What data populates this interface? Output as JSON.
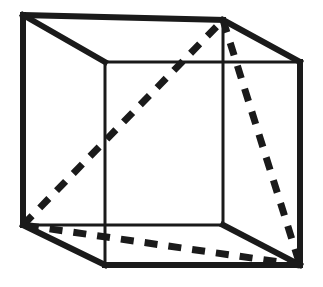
{
  "figure": {
    "type": "line-diagram",
    "canvas": {
      "width": 323,
      "height": 287,
      "background": "#ffffff"
    },
    "ink_color": "#1a1a1a",
    "stroke_widths": {
      "front_edges": 6,
      "back_edges": 3,
      "dashed": 7
    },
    "dash_pattern": "13 11",
    "vertices": {
      "back_top_left": {
        "x": 23,
        "y": 15
      },
      "back_top_right": {
        "x": 223,
        "y": 20
      },
      "back_bottom_left": {
        "x": 23,
        "y": 225
      },
      "back_bottom_right": {
        "x": 223,
        "y": 225
      },
      "front_top_left": {
        "x": 105,
        "y": 62
      },
      "front_top_right": {
        "x": 300,
        "y": 62
      },
      "front_bottom_left": {
        "x": 105,
        "y": 265
      },
      "front_bottom_right": {
        "x": 300,
        "y": 265
      }
    },
    "solid_edges": [
      {
        "name": "back-top-edge",
        "from": "back_top_left",
        "to": "back_top_right",
        "weight": "front"
      },
      {
        "name": "back-left-vertical-edge",
        "from": "back_top_left",
        "to": "back_bottom_left",
        "weight": "front"
      },
      {
        "name": "back-bottom-edge",
        "from": "back_bottom_left",
        "to": "back_bottom_right",
        "weight": "back"
      },
      {
        "name": "back-right-vertical-edge",
        "from": "back_top_right",
        "to": "back_bottom_right",
        "weight": "back"
      },
      {
        "name": "top-left-connector-edge",
        "from": "back_top_left",
        "to": "front_top_left",
        "weight": "front"
      },
      {
        "name": "top-right-connector-edge",
        "from": "back_top_right",
        "to": "front_top_right",
        "weight": "front"
      },
      {
        "name": "bottom-left-connector-edge",
        "from": "back_bottom_left",
        "to": "front_bottom_left",
        "weight": "front"
      },
      {
        "name": "bottom-right-connector-edge",
        "from": "back_bottom_right",
        "to": "front_bottom_right",
        "weight": "front"
      },
      {
        "name": "front-top-edge",
        "from": "front_top_left",
        "to": "front_top_right",
        "weight": "back"
      },
      {
        "name": "front-left-vertical-edge",
        "from": "front_top_left",
        "to": "front_bottom_left",
        "weight": "back"
      },
      {
        "name": "front-bottom-edge",
        "from": "front_bottom_left",
        "to": "front_bottom_right",
        "weight": "front"
      },
      {
        "name": "front-right-vertical-edge",
        "from": "front_top_right",
        "to": "front_bottom_right",
        "weight": "front"
      }
    ],
    "dashed_triangle": {
      "name": "inscribed-triangle",
      "vertices": [
        "back_bottom_left",
        "back_top_right",
        "front_bottom_right"
      ],
      "segments": [
        {
          "name": "triangle-edge-rising",
          "from": "back_bottom_left",
          "to": "back_top_right"
        },
        {
          "name": "triangle-edge-falling",
          "from": "back_top_right",
          "to": "front_bottom_right"
        },
        {
          "name": "triangle-edge-base",
          "from": "front_bottom_right",
          "to": "back_bottom_left"
        }
      ]
    }
  }
}
